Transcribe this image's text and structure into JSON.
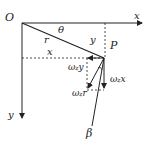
{
  "diagram": {
    "labels": {
      "origin": "O",
      "x_axis": "x",
      "y_axis": "y",
      "theta": "θ",
      "r": "r",
      "y_dist": "y",
      "x_dist": "x",
      "point": "P",
      "beta": "β",
      "omega": "ω",
      "z": "z",
      "wy_var": "y",
      "wx_var": "x",
      "wr_var": "r"
    },
    "colors": {
      "line": "#222222",
      "background": "#ffffff"
    }
  }
}
